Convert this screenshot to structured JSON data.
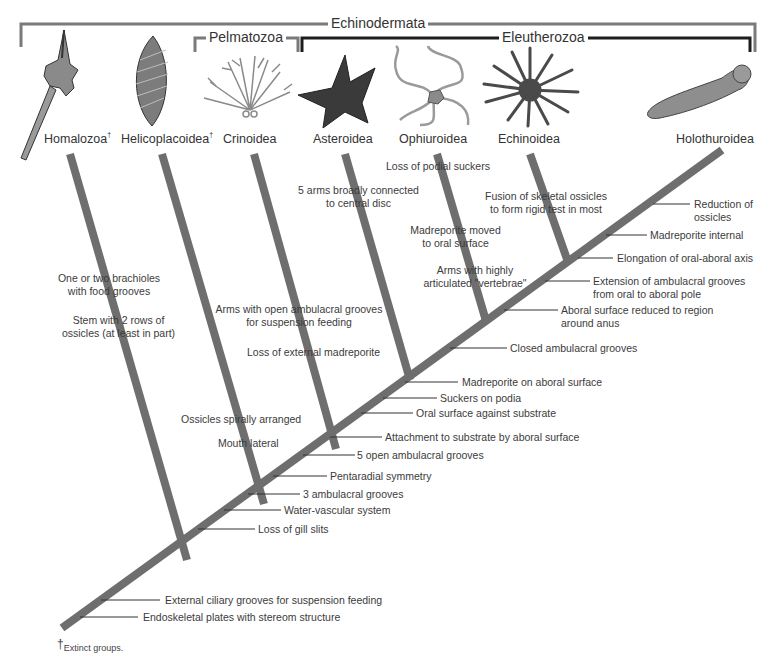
{
  "groups": {
    "echinodermata": "Echinodermata",
    "pelmatozoa": "Pelmatozoa",
    "eleutherozoa": "Eleutherozoa"
  },
  "taxa": [
    {
      "name": "Homalozoa",
      "extinct": true
    },
    {
      "name": "Helicoplacoidea",
      "extinct": true
    },
    {
      "name": "Crinoidea",
      "extinct": false
    },
    {
      "name": "Asteroidea",
      "extinct": false
    },
    {
      "name": "Ophiuroidea",
      "extinct": false
    },
    {
      "name": "Echinoidea",
      "extinct": false
    },
    {
      "name": "Holothuroidea",
      "extinct": false
    }
  ],
  "dagger": "†",
  "branch_characters": {
    "homalozoa": [
      "One or two brachioles\nwith food grooves",
      "Stem with 2 rows of\nossicles (at least in part)"
    ],
    "helicoplacoidea": [
      "Ossicles spirally arranged",
      "Mouth lateral"
    ],
    "crinoidea": [
      "Arms with open ambulacral grooves\nfor suspension feeding",
      "Loss of external madreporite"
    ],
    "asteroidea": [
      "5 arms broadly connected\nto central disc"
    ],
    "ophiuroidea": [
      "Loss of podial suckers",
      "Madreporite moved\nto oral surface",
      "Arms with highly\narticulated \"vertebrae\""
    ],
    "echinoidea": [
      "Fusion of skeletal ossicles\nto form rigid test in most"
    ]
  },
  "trunk_characters": [
    "Reduction of\nossicles",
    "Madreporite internal",
    "Elongation of oral-aboral axis",
    "Extension of ambulacral grooves\nfrom oral to aboral pole",
    "Aboral surface reduced to region\naround anus",
    "Closed ambulacral grooves",
    "Madreporite on aboral surface",
    "Suckers on podia",
    "Oral surface against substrate",
    "Attachment to substrate by aboral surface",
    "5 open ambulacral grooves",
    "Pentaradial symmetry",
    "3 ambulacral grooves",
    "Water-vascular system",
    "Loss of gill slits",
    "External ciliary grooves for suspension feeding",
    "Endoskeletal plates with stereom structure"
  ],
  "footnote": "Extinct groups.",
  "colors": {
    "branch": "#6e6e6e",
    "echinodermata_bracket": "#7a7a7a",
    "pelmatozoa_bracket": "#7a7a7a",
    "eleutherozoa_bracket": "#1e1e1e",
    "leader_line": "#333333"
  }
}
